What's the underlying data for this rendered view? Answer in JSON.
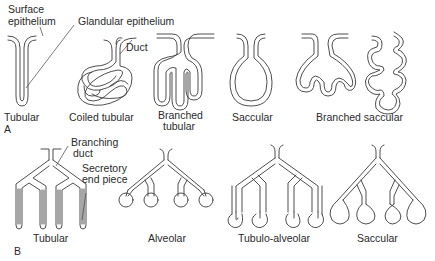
{
  "panel_a": {
    "letter": "A",
    "callouts": {
      "surface_epithelium_line1": "Surface",
      "surface_epithelium_line2": "epithelium",
      "glandular_epithelium": "Glandular epithelium",
      "duct": "Duct"
    },
    "glands": [
      {
        "label": "Tubular"
      },
      {
        "label": "Coiled tubular"
      },
      {
        "label_line1": "Branched",
        "label_line2": "tubular"
      },
      {
        "label": "Saccular"
      },
      {
        "label": "Branched saccular"
      }
    ]
  },
  "panel_b": {
    "letter": "B",
    "callouts": {
      "branching_duct_line1": "Branching",
      "branching_duct_line2": "duct",
      "secretory_line1": "Secretory",
      "secretory_line2": "end piece"
    },
    "glands": [
      {
        "label": "Tubular"
      },
      {
        "label": "Alveolar"
      },
      {
        "label": "Tubulo-alveolar"
      },
      {
        "label": "Saccular"
      }
    ]
  }
}
